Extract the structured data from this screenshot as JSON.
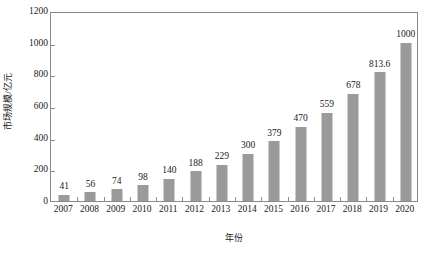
{
  "chart_data": {
    "type": "bar",
    "title": "",
    "xlabel": "年份",
    "ylabel": "市场规模/亿元",
    "categories": [
      "2007",
      "2008",
      "2009",
      "2010",
      "2011",
      "2012",
      "2013",
      "2014",
      "2015",
      "2016",
      "2017",
      "2018",
      "2019",
      "2020"
    ],
    "values": [
      41,
      56,
      74,
      98,
      140,
      188,
      229,
      300,
      379,
      470,
      559,
      678,
      813.6,
      1000
    ],
    "value_labels": [
      "41",
      "56",
      "74",
      "98",
      "140",
      "188",
      "229",
      "300",
      "379",
      "470",
      "559",
      "678",
      "813.6",
      "1000"
    ],
    "ylim": [
      0,
      1200
    ],
    "yticks": [
      0,
      200,
      400,
      600,
      800,
      1000,
      1200
    ],
    "ytick_labels": [
      "0",
      "200",
      "400",
      "600",
      "800",
      "1000",
      "1200"
    ],
    "grid": false,
    "legend": false,
    "legend_position": "none",
    "series": [
      {
        "name": "市场规模",
        "values": [
          41,
          56,
          74,
          98,
          140,
          188,
          229,
          300,
          379,
          470,
          559,
          678,
          813.6,
          1000
        ]
      }
    ],
    "colors": {
      "bar_fill": "#9a9a9a",
      "axis": "#8a8a8a",
      "text": "#1a1a1a",
      "background": "#ffffff"
    }
  }
}
